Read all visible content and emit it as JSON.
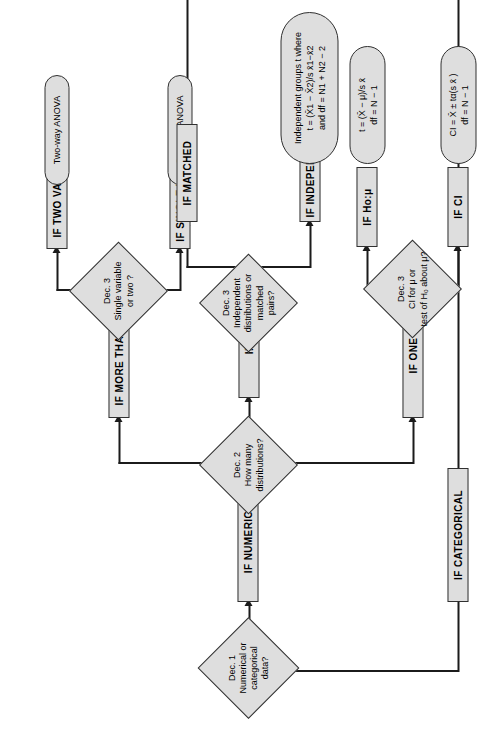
{
  "diagram": {
    "colors": {
      "fill": "#dedede",
      "stroke": "#303030",
      "line": "#1b1b1b"
    },
    "decisions": {
      "dec1": {
        "label": "Dec. 1",
        "line2": "Numerical or",
        "line3": "categorical",
        "line4": "data?"
      },
      "dec2": {
        "label": "Dec. 2",
        "line2": "How many",
        "line3": "distributions?"
      },
      "dec3_indep": {
        "label": "Dec. 3",
        "line2": "Independent",
        "line3": "distributions or",
        "line4": "matched",
        "line5": "pairs?"
      },
      "dec3_anova": {
        "label": "Dec. 3",
        "line2": "Single variable",
        "line3": "or two ?"
      },
      "dec3_ci": {
        "label": "Dec. 3",
        "line2": "CI for μ or",
        "line3": "test of H₀ about μ?"
      }
    },
    "branches": {
      "if_numerical": "IF NUMERICAL",
      "if_categorical": "IF CATEGORICAL",
      "if_more_than_two": "IF MORE THAN TWO",
      "if_two": "IF TWO",
      "if_one": "IF ONE",
      "if_single_variable": "IF SINGLE VARIABLE",
      "if_two_variables": "IF TWO VARIABLES",
      "if_independent": "IF INDEPENDENT",
      "if_matched": "IF MATCHED",
      "if_ci": "IF CI",
      "if_ho": "IF Ho:μ"
    },
    "results": {
      "one_way_anova": "One-way ANOVA",
      "two_way_anova": "Two-way ANOVA",
      "independent_groups": {
        "line1": "Independent groups t where",
        "line2": "t = (X̄1 − X̄2)/s x̄1−x̄2",
        "line3": "and df = N1 + N2 − 2"
      },
      "one_sample_t": {
        "line1": "t = (X̄ − μ)/s x̄",
        "line2": "df = N − 1"
      },
      "confidence_interval": {
        "line1": "CI = X̄ ± tα(s x̄ )",
        "line2": "df = N − 1"
      }
    }
  }
}
